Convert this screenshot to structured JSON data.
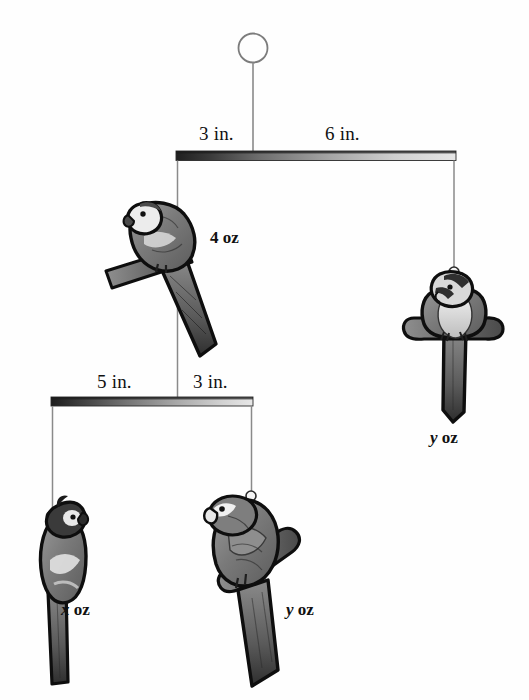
{
  "figure": {
    "type": "bird-mobile-balance-diagram",
    "background_color": "#fefefe",
    "ink_color": "#111111",
    "caption": ""
  },
  "top_assembly": {
    "ring_label": "hanging-ring",
    "beam_label": "top-beam",
    "left_arm_length": "3 in.",
    "right_arm_length": "6 in."
  },
  "lower_assembly": {
    "beam_label": "lower-beam",
    "left_arm_length": "5 in.",
    "right_arm_length": "3 in."
  },
  "weights": {
    "top_left_bird": "4 oz",
    "top_right_bird_var": "y",
    "top_right_bird_unit": "oz",
    "bottom_left_bird_var": "x",
    "bottom_left_bird_unit": "oz",
    "bottom_right_bird_var": "y",
    "bottom_right_bird_unit": "oz"
  },
  "birds": [
    {
      "name": "top-left-parrot",
      "weight": "4 oz",
      "pose": "perched-side"
    },
    {
      "name": "top-right-parrot",
      "weight": "y oz",
      "pose": "front-facing"
    },
    {
      "name": "bottom-left-parrot",
      "weight": "x oz",
      "pose": "standing-side"
    },
    {
      "name": "bottom-right-parrot",
      "weight": "y oz",
      "pose": "perched-front"
    }
  ],
  "colors": {
    "beam_dark": "#2b2b2b",
    "beam_light": "#dcdcdc",
    "string": "#8a8a8a",
    "bird_outline": "#111111",
    "bird_body": "#7d7d7d",
    "bird_light": "#d9d9d9"
  }
}
